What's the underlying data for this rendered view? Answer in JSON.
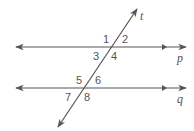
{
  "diagram": {
    "type": "parallel lines cut by a transversal",
    "colors": {
      "line": "#555555",
      "text": "#555555",
      "background": "#ffffff"
    },
    "lines": {
      "p": {
        "label": "p"
      },
      "q": {
        "label": "q"
      },
      "t": {
        "label": "t"
      }
    },
    "angles": [
      {
        "id": 1,
        "label": "1"
      },
      {
        "id": 2,
        "label": "2"
      },
      {
        "id": 3,
        "label": "3"
      },
      {
        "id": 4,
        "label": "4"
      },
      {
        "id": 5,
        "label": "5"
      },
      {
        "id": 6,
        "label": "6"
      },
      {
        "id": 7,
        "label": "7"
      },
      {
        "id": 8,
        "label": "8"
      }
    ]
  }
}
